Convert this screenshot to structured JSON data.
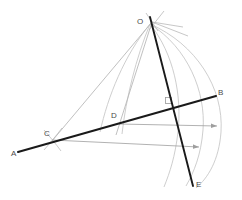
{
  "figure": {
    "kind": "geometry-construction",
    "width": 242,
    "height": 200,
    "background": "#ffffff"
  },
  "labels": {
    "O": "O",
    "A": "A",
    "B": "B",
    "C": "C",
    "D": "D",
    "E": "E",
    "F": ""
  },
  "colors": {
    "primary_line": "#1a1a1a",
    "construction_line": "#b9b9b9",
    "arc": "#c2c2c2",
    "arrow": "#9e9e9e",
    "label_text": "#4a4a4a",
    "faint_label_text": "#9a9a9a"
  },
  "points": {
    "O": {
      "x": 152,
      "y": 22
    },
    "A": {
      "x": 18,
      "y": 152
    },
    "B": {
      "x": 216,
      "y": 96
    },
    "C": {
      "x": 52,
      "y": 140
    },
    "D": {
      "x": 119,
      "y": 124
    },
    "E": {
      "x": 193,
      "y": 186
    },
    "F": {
      "x": 170,
      "y": 103
    }
  },
  "segments": [
    {
      "name": "line-AB",
      "from": "A",
      "to": "B",
      "style": "primary",
      "width": 2.1
    },
    {
      "name": "line-OE",
      "from": "O",
      "to": "E",
      "style": "primary",
      "width": 1.9
    },
    {
      "name": "line-OC",
      "from": "O",
      "to": "C",
      "style": "construction",
      "width": 0.9
    },
    {
      "name": "line-OD",
      "from": "O",
      "to": "D",
      "style": "construction",
      "width": 0.9
    }
  ],
  "construction_rays": [
    {
      "name": "ray-O-upper-left",
      "x1": 146,
      "y1": 14,
      "x2": 157,
      "y2": 30
    },
    {
      "name": "ray-O-upper-right",
      "x1": 162,
      "y1": 12,
      "x2": 150,
      "y2": 29
    },
    {
      "name": "ray-O-right-1",
      "x1": 152,
      "y1": 22,
      "x2": 186,
      "y2": 35
    },
    {
      "name": "ray-O-right-2",
      "x1": 152,
      "y1": 22,
      "x2": 181,
      "y2": 28
    }
  ],
  "arcs": [
    {
      "name": "arc-outer",
      "d": "M 150 24 C 196 44 224 88 221 132 C 219 160 208 178 196 188"
    },
    {
      "name": "arc-second",
      "d": "M 150 24 C 188 48 206 92 203 130 C 201 155 194 172 186 186"
    },
    {
      "name": "arc-third",
      "d": "M 150 24 C 174 54 182 96 178 132 C 175 157 170 172 164 187"
    },
    {
      "name": "arc-fourth",
      "d": "M 150 24 C 136 58 126 98 122 134"
    },
    {
      "name": "arc-fifth",
      "d": "M 150 24 C 124 56 108 96 100 132"
    },
    {
      "name": "arc-C-cross-1",
      "d": "M 44 130 C 50 137 56 144 61 151"
    },
    {
      "name": "arc-C-cross-2",
      "d": "M 62 128 C 56 136 50 143 44 150"
    }
  ],
  "arrows": [
    {
      "name": "arrow-upper",
      "from": {
        "x": 119,
        "y": 124
      },
      "to": {
        "x": 219,
        "y": 126
      },
      "label": ""
    },
    {
      "name": "arrow-lower",
      "from": {
        "x": 52,
        "y": 140
      },
      "to": {
        "x": 201,
        "y": 147
      },
      "label": ""
    }
  ],
  "markers": {
    "right_angle_at_F": {
      "x": 166,
      "y": 99,
      "size": 6
    }
  }
}
